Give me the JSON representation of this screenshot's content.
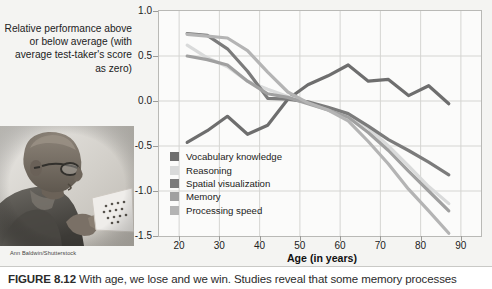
{
  "figure": {
    "caption_number": "FIGURE 8.12",
    "caption_text": "With age, we lose and we win. Studies reveal that some memory processes",
    "credit": "Ann Baldwin/Shutterstock",
    "photo_alt": "elderly-man-reading-paper"
  },
  "axes": {
    "ylabel": "Relative performance above or below average (with average test-taker's score as zero)",
    "xlabel": "Age (in years)",
    "yticks": [
      "1.0",
      "0.5",
      "0.0",
      "-0.5",
      "-1.0",
      "-1.5"
    ],
    "xticks": [
      "20",
      "30",
      "40",
      "50",
      "60",
      "70",
      "80",
      "90"
    ]
  },
  "legend": {
    "items": [
      {
        "label": "Vocabulary knowledge",
        "color": "#6e6e6e"
      },
      {
        "label": "Reasoning",
        "color": "#d9dada"
      },
      {
        "label": "Spatial visualization",
        "color": "#7b7b7b"
      },
      {
        "label": "Memory",
        "color": "#a0a0a0"
      },
      {
        "label": "Processing speed",
        "color": "#b4b4b4"
      }
    ]
  },
  "chart_data": {
    "type": "line",
    "title": "",
    "xlabel": "Age (in years)",
    "ylabel": "Relative performance above or below average (with average test-taker's score as zero)",
    "xlim": [
      15,
      95
    ],
    "ylim": [
      -1.5,
      1.0
    ],
    "grid": true,
    "legend_position": "inside-lower-left",
    "x": [
      22,
      27,
      32,
      37,
      42,
      47,
      52,
      57,
      62,
      67,
      72,
      77,
      82,
      87
    ],
    "series": [
      {
        "name": "Vocabulary knowledge",
        "color": "#6e6e6e",
        "values": [
          -0.46,
          -0.33,
          -0.17,
          -0.37,
          -0.27,
          0.02,
          0.18,
          0.28,
          0.4,
          0.22,
          0.24,
          0.06,
          0.17,
          -0.03
        ]
      },
      {
        "name": "Reasoning",
        "color": "#d9dada",
        "values": [
          0.62,
          0.48,
          0.38,
          0.22,
          0.13,
          0.05,
          -0.02,
          -0.08,
          -0.15,
          -0.3,
          -0.5,
          -0.72,
          -0.95,
          -1.14
        ]
      },
      {
        "name": "Spatial visualization",
        "color": "#7b7b7b",
        "values": [
          0.75,
          0.73,
          0.58,
          0.33,
          0.03,
          0.02,
          -0.01,
          -0.07,
          -0.14,
          -0.28,
          -0.43,
          -0.55,
          -0.68,
          -0.82
        ]
      },
      {
        "name": "Memory",
        "color": "#a0a0a0",
        "values": [
          0.5,
          0.46,
          0.4,
          0.22,
          0.08,
          0.04,
          -0.03,
          -0.1,
          -0.18,
          -0.35,
          -0.55,
          -0.78,
          -1.0,
          -1.22
        ]
      },
      {
        "name": "Processing speed",
        "color": "#b4b4b4",
        "values": [
          0.74,
          0.72,
          0.7,
          0.56,
          0.32,
          0.1,
          -0.02,
          -0.1,
          -0.22,
          -0.45,
          -0.7,
          -0.98,
          -1.22,
          -1.47
        ]
      }
    ]
  }
}
